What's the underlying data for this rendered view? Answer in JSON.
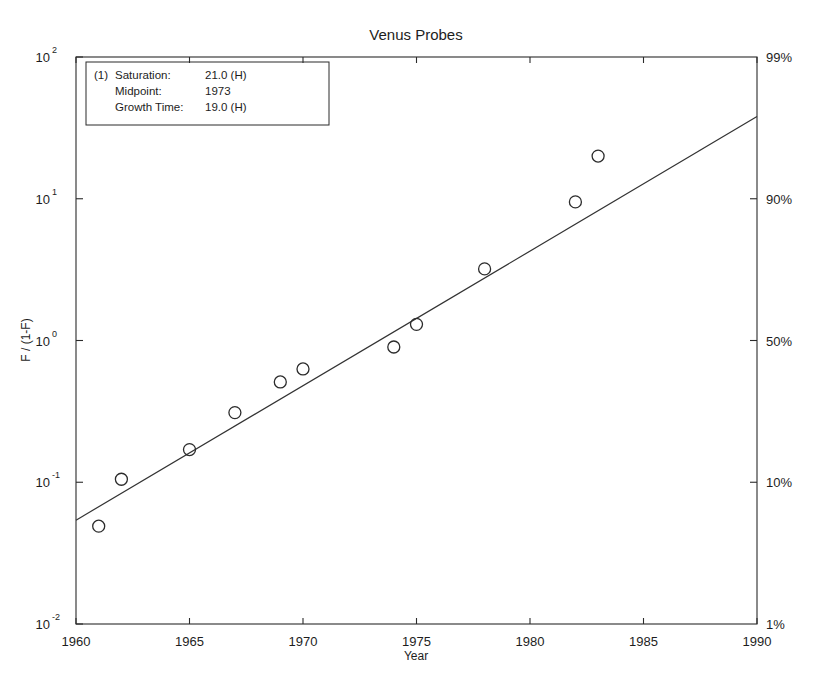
{
  "chart_data": {
    "type": "scatter",
    "title": "Venus Probes",
    "xlabel": "Year",
    "ylabel": "F / (1-F)",
    "xlim": [
      1960,
      1990
    ],
    "ylim": [
      0.01,
      100
    ],
    "yscale": "log",
    "grid": false,
    "legend": "none",
    "x_ticks": [
      1960,
      1965,
      1970,
      1975,
      1980,
      1985,
      1990
    ],
    "x_tick_labels": [
      "1960",
      "1965",
      "1970",
      "1975",
      "1980",
      "1985",
      "1990"
    ],
    "y_ticks": [
      0.01,
      0.1,
      1,
      10,
      100
    ],
    "y_tick_labels": [
      "10-2",
      "10-1",
      "100",
      "101",
      "102"
    ],
    "y_tick_bases": [
      "10",
      "10",
      "10",
      "10",
      "10"
    ],
    "y_tick_exponents": [
      "-2",
      "-1",
      "0",
      "1",
      "2"
    ],
    "right_axis_label": "percent",
    "right_ticks_values": [
      0.01,
      0.1,
      1,
      10,
      100
    ],
    "right_tick_labels": [
      "1%",
      "10%",
      "50%",
      "90%",
      "99%"
    ],
    "x": [
      1961,
      1962,
      1965,
      1967,
      1969,
      1970,
      1974,
      1975,
      1978,
      1982,
      1983
    ],
    "y": [
      0.049,
      0.105,
      0.17,
      0.31,
      0.51,
      0.63,
      0.9,
      1.3,
      3.2,
      9.5,
      20.0
    ],
    "series": [
      {
        "name": "Venus probes data",
        "marker": "circle-open",
        "x": [
          1961,
          1962,
          1965,
          1967,
          1969,
          1970,
          1974,
          1975,
          1978,
          1982,
          1983
        ],
        "values": [
          0.049,
          0.105,
          0.17,
          0.31,
          0.51,
          0.63,
          0.9,
          1.3,
          3.2,
          9.5,
          20.0
        ]
      },
      {
        "name": "Logistic fit line",
        "marker": "none",
        "x": [
          1960,
          1990
        ],
        "values": [
          0.054,
          38.0
        ]
      }
    ],
    "annotation": {
      "index_label": "(1)",
      "rows": [
        {
          "label": "Saturation:",
          "value": "21.0 (H)"
        },
        {
          "label": "Midpoint:",
          "value": "1973"
        },
        {
          "label": "Growth Time:",
          "value": "19.0 (H)"
        }
      ]
    }
  },
  "colors": {
    "axis": "#2b2b2b",
    "line": "#333333",
    "marker": "#2b2b2b",
    "background": "#ffffff"
  }
}
